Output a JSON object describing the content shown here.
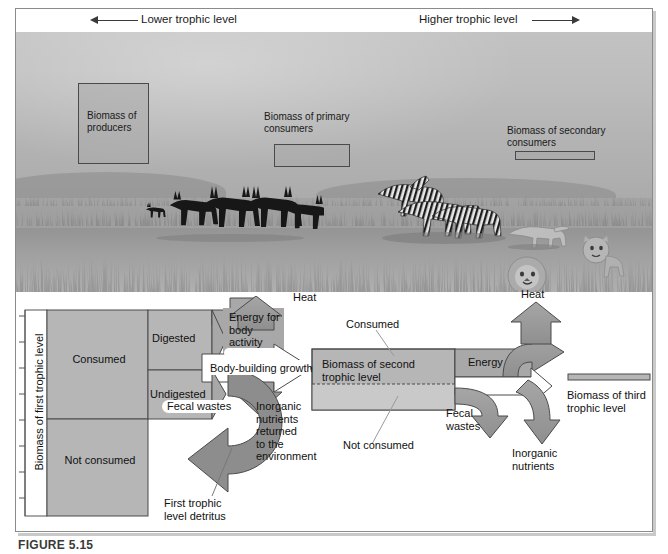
{
  "figure": {
    "caption": "FIGURE 5.15"
  },
  "header": {
    "lower_label": "Lower trophic level",
    "higher_label": "Higher trophic level",
    "left_arrow_icon": "arrow-left-icon",
    "right_arrow_icon": "arrow-right-icon"
  },
  "illustration": {
    "alt": "savanna-scene",
    "callouts": [
      {
        "id": "producers",
        "label": "Biomass of\nproducers"
      },
      {
        "id": "primary",
        "label": "Biomass of\nprimary consumers"
      },
      {
        "id": "secondary",
        "label": "Biomass of\nsecondary consumers"
      }
    ],
    "animals": [
      "antelope-herd",
      "zebra-herd",
      "lion",
      "lioness",
      "cheetah"
    ]
  },
  "flow": {
    "axis_label": "Biomass of first trophic level",
    "first_level": {
      "consumed": "Consumed",
      "not_consumed": "Not consumed",
      "digested": "Digested",
      "undigested": "Undigested"
    },
    "energy_body": "Energy for\nbody\nactivity",
    "heat_1": "Heat",
    "body_building": "Body-building growth",
    "fecal_wastes_1": "Fecal wastes",
    "detritus": "First trophic\nlevel detritus",
    "inorganic_1": "Inorganic\nnutrients\nreturned\nto the\nenvironment",
    "second_level": {
      "title": "Biomass of second\ntrophic level",
      "consumed": "Consumed",
      "not_consumed": "Not consumed"
    },
    "energy_2": "Energy",
    "heat_2": "Heat",
    "fecal_wastes_2": "Fecal\nwastes",
    "inorganic_2": "Inorganic\nnutrients",
    "third_level": "Biomass of third\ntrophic level"
  },
  "colors": {
    "box_fill": "#b6b6b6",
    "arrow_fill": "#9a9a9a",
    "arrow_dark": "#8d8d8d",
    "outline": "#3a3a3a",
    "frame": "#8b8b8b",
    "panel_light": "#c8c8c8"
  }
}
